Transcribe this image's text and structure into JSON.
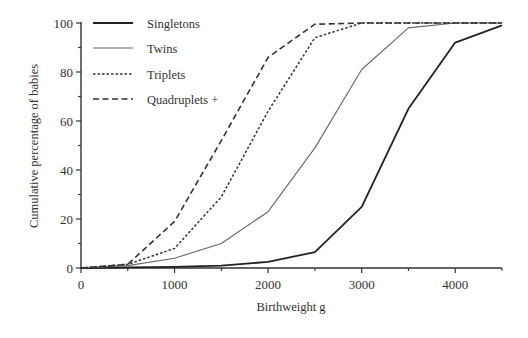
{
  "chart_data": {
    "type": "line",
    "title": "",
    "xlabel": "Birthweight g",
    "ylabel": "Cumulative percentage of babies",
    "xlim": [
      0,
      4500
    ],
    "ylim": [
      0,
      100
    ],
    "x_ticks": [
      0,
      1000,
      2000,
      3000,
      4000
    ],
    "x_minor_ticks": [
      500,
      1500,
      2500,
      3500,
      4500
    ],
    "y_ticks": [
      0,
      20,
      40,
      60,
      80,
      100
    ],
    "y_minor_ticks": [
      10,
      30,
      50,
      70,
      90
    ],
    "grid": false,
    "legend_position": "upper-left",
    "x": [
      0,
      500,
      1000,
      1500,
      2000,
      2500,
      3000,
      3500,
      4000,
      4500
    ],
    "series": [
      {
        "name": "Singletons",
        "style": "solid",
        "color": "#222222",
        "width": 1.8,
        "values": [
          0,
          0.3,
          0.5,
          1,
          2.5,
          6.5,
          25,
          65,
          92,
          99
        ]
      },
      {
        "name": "Twins",
        "style": "thin-solid",
        "color": "#666666",
        "width": 1.1,
        "values": [
          0,
          1,
          4,
          10,
          23,
          49,
          81,
          98,
          100,
          100
        ]
      },
      {
        "name": "Triplets",
        "style": "dotted",
        "color": "#333333",
        "width": 1.5,
        "values": [
          0,
          1.5,
          8,
          29,
          64,
          94,
          100,
          100,
          100,
          100
        ]
      },
      {
        "name": "Quadruplets +",
        "style": "dashed",
        "color": "#333333",
        "width": 1.6,
        "values": [
          0,
          1.5,
          19,
          52,
          86,
          99.5,
          100,
          100,
          100,
          100
        ]
      }
    ]
  }
}
